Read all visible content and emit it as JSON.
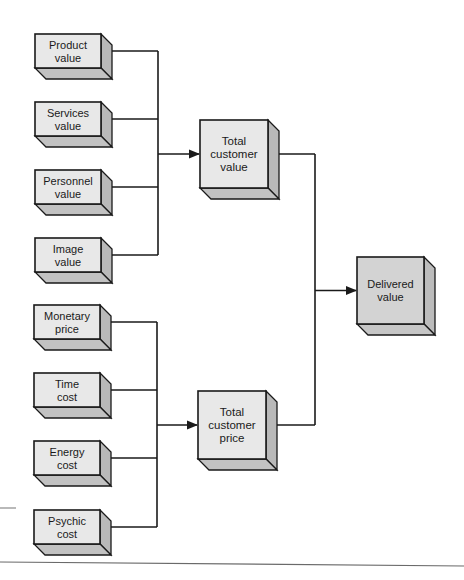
{
  "diagram": {
    "title": "",
    "colors": {
      "front": "#e8e8e8",
      "side": "#b9b9b9",
      "bottom": "#c2c2c2",
      "front_highlight": "#d3d3d3",
      "side_highlight": "#bcbcbc",
      "bottom_highlight": "#c6c6c6",
      "line": "#1a1a1a"
    },
    "nodes": [
      {
        "id": "product-value",
        "lines": [
          "Product",
          "value"
        ],
        "x": 35,
        "y": 34,
        "w": 66,
        "h": 34,
        "group": "value-inputs"
      },
      {
        "id": "services-value",
        "lines": [
          "Services",
          "value"
        ],
        "x": 35,
        "y": 102,
        "w": 66,
        "h": 34,
        "group": "value-inputs"
      },
      {
        "id": "personnel-value",
        "lines": [
          "Personnel",
          "value"
        ],
        "x": 35,
        "y": 170,
        "w": 66,
        "h": 34,
        "group": "value-inputs"
      },
      {
        "id": "image-value",
        "lines": [
          "Image",
          "value"
        ],
        "x": 35,
        "y": 238,
        "w": 66,
        "h": 34,
        "group": "value-inputs"
      },
      {
        "id": "monetary-price",
        "lines": [
          "Monetary",
          "price"
        ],
        "x": 34,
        "y": 305,
        "w": 66,
        "h": 34,
        "group": "price-inputs"
      },
      {
        "id": "time-cost",
        "lines": [
          "Time",
          "cost"
        ],
        "x": 34,
        "y": 373,
        "w": 66,
        "h": 34,
        "group": "price-inputs"
      },
      {
        "id": "energy-cost",
        "lines": [
          "Energy",
          "cost"
        ],
        "x": 34,
        "y": 441,
        "w": 66,
        "h": 34,
        "group": "price-inputs"
      },
      {
        "id": "psychic-cost",
        "lines": [
          "Psychic",
          "cost"
        ],
        "x": 34,
        "y": 510,
        "w": 66,
        "h": 34,
        "group": "price-inputs"
      },
      {
        "id": "total-customer-value",
        "lines": [
          "Total",
          "customer",
          "value"
        ],
        "x": 200,
        "y": 120,
        "w": 68,
        "h": 68,
        "group": "totals"
      },
      {
        "id": "total-customer-price",
        "lines": [
          "Total",
          "customer",
          "price"
        ],
        "x": 198,
        "y": 391,
        "w": 68,
        "h": 68,
        "group": "totals"
      },
      {
        "id": "delivered-value",
        "lines": [
          "Delivered",
          "value"
        ],
        "x": 357,
        "y": 257,
        "w": 67,
        "h": 67,
        "group": "result",
        "highlight": true
      }
    ],
    "depth": 11,
    "edges": [
      {
        "from": [
          "product-value",
          "services-value",
          "personnel-value",
          "image-value"
        ],
        "to": "total-customer-value",
        "bus_x": 158
      },
      {
        "from": [
          "monetary-price",
          "time-cost",
          "energy-cost",
          "psychic-cost"
        ],
        "to": "total-customer-price",
        "bus_x": 157
      },
      {
        "from": [
          "total-customer-value",
          "total-customer-price"
        ],
        "to": "delivered-value",
        "bus_x": 315
      }
    ],
    "page_rules": [
      {
        "x1": 0,
        "y1": 508,
        "x2": 16,
        "y2": 508,
        "color": "#8a8a8a",
        "width": 1.2
      },
      {
        "x1": 0,
        "y1": 562,
        "x2": 464,
        "y2": 566,
        "color": "#6a6a6a",
        "width": 1.2
      }
    ]
  }
}
